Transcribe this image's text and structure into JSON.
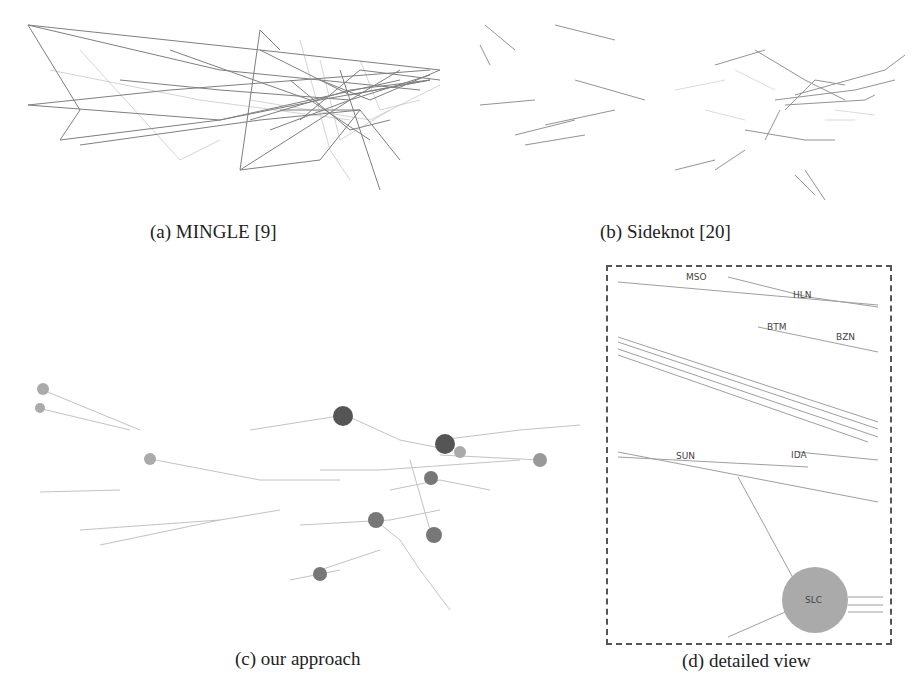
{
  "figure": {
    "panels": [
      {
        "id": "a",
        "caption": "(a) MINGLE [9]"
      },
      {
        "id": "b",
        "caption": "(b) Sideknot [20]"
      },
      {
        "id": "c",
        "caption": "(c) our approach"
      },
      {
        "id": "d",
        "caption": "(d) detailed view"
      }
    ],
    "detailed_view": {
      "labels": [
        "MSO",
        "HLN",
        "BTM",
        "BZN",
        "SUN",
        "IDA",
        "SLC"
      ]
    }
  }
}
